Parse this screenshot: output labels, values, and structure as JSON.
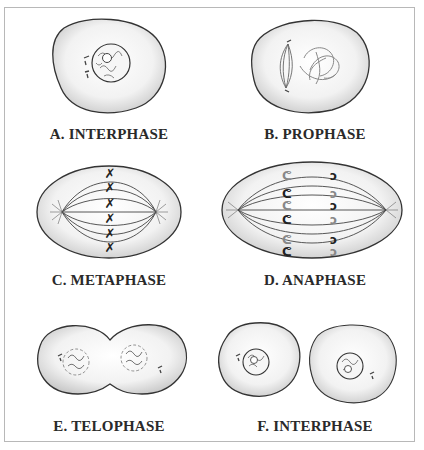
{
  "figure": {
    "panels": [
      {
        "id": "A",
        "label": "A.  INTERPHASE"
      },
      {
        "id": "B",
        "label": "B.  PROPHASE"
      },
      {
        "id": "C",
        "label": "C.  METAPHASE"
      },
      {
        "id": "D",
        "label": "D.  ANAPHASE"
      },
      {
        "id": "E",
        "label": "E.  TELOPHASE"
      },
      {
        "id": "F",
        "label": "F.  INTERPHASE"
      }
    ]
  },
  "colors": {
    "cell_fill_center": "#ffffff",
    "cell_fill_edge": "#cfcfcf",
    "outline": "#333333",
    "chromosome": "#222222",
    "frame": "#b8b8b8"
  }
}
